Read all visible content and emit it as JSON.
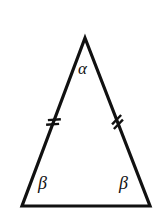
{
  "figure": {
    "kind": "isosceles-triangle-diagram",
    "background_color": "#ffffff",
    "stroke_color": "#111111",
    "stroke_width": 3.2,
    "canvas": {
      "width": 161,
      "height": 222
    },
    "vertices": {
      "apex": {
        "x": 85,
        "y": 38
      },
      "bottom_left": {
        "x": 22,
        "y": 206
      },
      "bottom_right": {
        "x": 150,
        "y": 206
      }
    },
    "labels": {
      "apex_angle": "α",
      "base_angle_left": "β",
      "base_angle_right": "β"
    },
    "congruence_marks": {
      "count_per_side": 2,
      "sides_marked": [
        "left-leg",
        "right-leg"
      ],
      "mark_length": 13,
      "mark_gap": 5,
      "stroke_width": 2.4,
      "left_midpoint": {
        "x": 53.5,
        "y": 122
      },
      "right_midpoint": {
        "x": 117.5,
        "y": 122
      }
    }
  }
}
